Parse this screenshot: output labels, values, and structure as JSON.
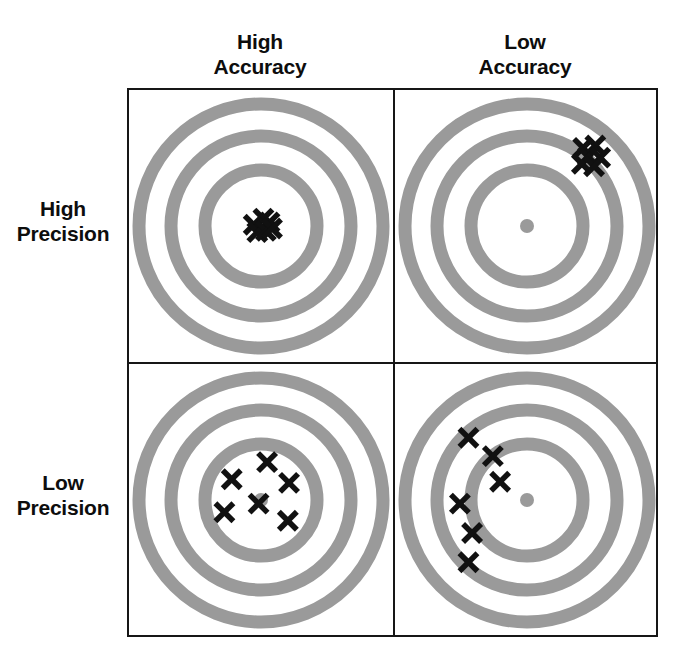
{
  "figure": {
    "colors": {
      "ring": "#9a9a9a",
      "background": "#ffffff",
      "frame": "#161616",
      "mark": "#111111",
      "bullseye_dot": "#9a9a9a"
    },
    "column_headers": [
      {
        "id": "high-accuracy",
        "line1": "High",
        "line2": "Accuracy"
      },
      {
        "id": "low-accuracy",
        "line1": "Low",
        "line2": "Accuracy"
      }
    ],
    "row_headers": [
      {
        "id": "high-precision",
        "line1": "High",
        "line2": "Precision"
      },
      {
        "id": "low-precision",
        "line1": "Low",
        "line2": "Precision"
      }
    ]
  },
  "chart_data": {
    "type": "scatter",
    "xlabel": "Accuracy",
    "ylabel": "Precision",
    "grid": false,
    "legend": "none",
    "target_geometry": {
      "center_x": 132,
      "center_y": 136,
      "ring_band_width": 13,
      "ring_radii": [
        122,
        90,
        56
      ],
      "inner_disc_radius": 33,
      "bullseye_dot_radius": 7
    },
    "panels": [
      {
        "id": "high-accuracy-high-precision",
        "row": "High Precision",
        "column": "High Accuracy",
        "accuracy": "high",
        "precision": "high",
        "has_bullseye_dot": false,
        "shot_count": 6,
        "cluster_center": [
          0.02,
          0.02
        ],
        "spread": 0.06,
        "shots": [
          [
            -0.06,
            -0.01
          ],
          [
            0.02,
            -0.06
          ],
          [
            0.07,
            -0.03
          ],
          [
            -0.03,
            0.05
          ],
          [
            0.04,
            0.04
          ],
          [
            0.09,
            0.02
          ]
        ]
      },
      {
        "id": "low-accuracy-high-precision",
        "row": "High Precision",
        "column": "Low Accuracy",
        "accuracy": "low",
        "precision": "high",
        "has_bullseye_dot": true,
        "shot_count": 6,
        "cluster_center": [
          0.53,
          -0.58
        ],
        "spread": 0.07,
        "shots": [
          [
            0.46,
            -0.64
          ],
          [
            0.56,
            -0.66
          ],
          [
            0.5,
            -0.57
          ],
          [
            0.6,
            -0.56
          ],
          [
            0.45,
            -0.51
          ],
          [
            0.55,
            -0.49
          ]
        ]
      },
      {
        "id": "high-accuracy-low-precision",
        "row": "Low Precision",
        "column": "High Accuracy",
        "accuracy": "high",
        "precision": "low",
        "has_bullseye_dot": true,
        "shot_count": 6,
        "cluster_center": [
          0.01,
          -0.04
        ],
        "spread": 0.3,
        "shots": [
          [
            0.05,
            -0.31
          ],
          [
            -0.24,
            -0.17
          ],
          [
            0.23,
            -0.14
          ],
          [
            -0.02,
            0.03
          ],
          [
            -0.3,
            0.1
          ],
          [
            0.22,
            0.17
          ]
        ]
      },
      {
        "id": "low-accuracy-low-precision",
        "row": "Low Precision",
        "column": "Low Accuracy",
        "accuracy": "low",
        "precision": "low",
        "has_bullseye_dot": true,
        "shot_count": 6,
        "cluster_center": [
          -0.39,
          0.08
        ],
        "spread": 0.4,
        "shots": [
          [
            -0.48,
            -0.51
          ],
          [
            -0.28,
            -0.36
          ],
          [
            -0.22,
            -0.15
          ],
          [
            -0.55,
            0.03
          ],
          [
            -0.45,
            0.27
          ],
          [
            -0.48,
            0.51
          ]
        ]
      }
    ]
  }
}
